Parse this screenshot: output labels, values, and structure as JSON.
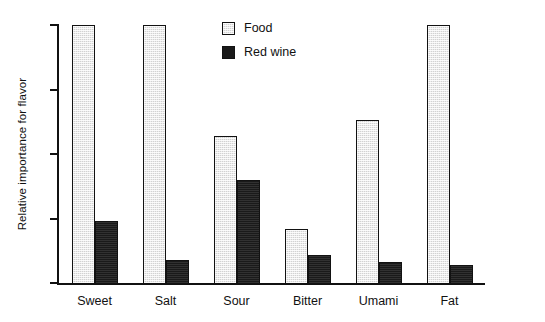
{
  "chart_data": {
    "type": "bar",
    "title": "",
    "xlabel": "",
    "ylabel": "Relative importance for flavor",
    "categories": [
      "Sweet",
      "Salt",
      "Sour",
      "Bitter",
      "Umami",
      "Fat"
    ],
    "series": [
      {
        "name": "Food",
        "color": "#d2d2d2",
        "values": [
          100,
          100,
          57,
          21,
          63,
          100
        ]
      },
      {
        "name": "Red wine",
        "color": "#1a1a1a",
        "values": [
          24,
          9,
          40,
          11,
          8,
          7
        ]
      }
    ],
    "ylim": [
      0,
      100
    ],
    "ytick_labels": [
      "",
      "",
      "",
      "",
      ""
    ],
    "ytick_values": [
      0,
      25,
      50,
      75,
      100
    ],
    "grid": false,
    "legend_position": "top-right",
    "axis_color": "#111111",
    "background": "#ffffff"
  },
  "legend": {
    "items": [
      {
        "label": "Food"
      },
      {
        "label": "Red wine"
      }
    ]
  }
}
